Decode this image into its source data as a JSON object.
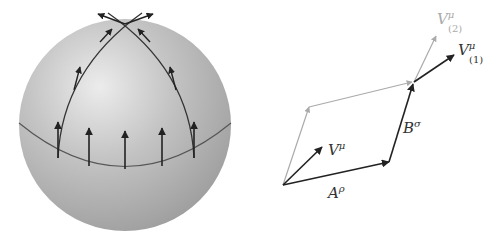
{
  "figure": {
    "left_panel": {
      "description": "Parallel transport of vectors on a sphere along two paths",
      "sphere_color": "#b9b9b9",
      "highlight_color": "#e6e6e6",
      "shadow_color": "#9a9a9a",
      "arrow_color": "#222222",
      "equator_arrows_count": 5
    },
    "right_panel": {
      "description": "Parallel transport around an infinitesimal loop",
      "labels": {
        "v_mu": {
          "base": "V",
          "sup": "μ"
        },
        "a_rho": {
          "base": "A",
          "sup": "ρ"
        },
        "b_sigma": {
          "base": "B",
          "sup": "σ"
        },
        "v1": {
          "base": "V",
          "sup": "μ",
          "sub": "(1)"
        },
        "v2": {
          "base": "V",
          "sup": "μ",
          "sub": "(2)"
        }
      },
      "dark_color": "#222222",
      "light_color": "#aaaaaa"
    }
  }
}
